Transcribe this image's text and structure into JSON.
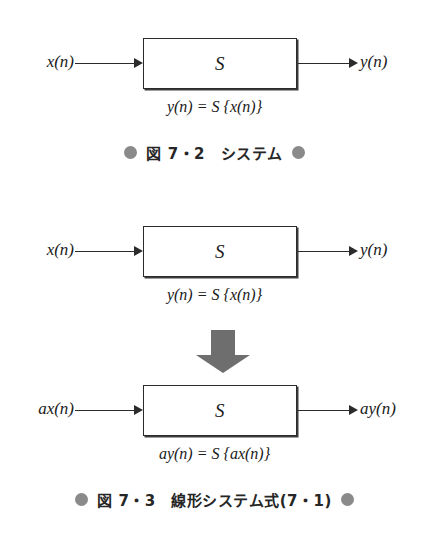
{
  "figure_1": {
    "box_label": "S",
    "input_label": "x(n)",
    "output_label": "y(n)",
    "formula": "y(n) = S {x(n)}",
    "caption": "図 7・2　システム"
  },
  "figure_2": {
    "upper": {
      "box_label": "S",
      "input_label": "x(n)",
      "output_label": "y(n)",
      "formula": "y(n) = S {x(n)}"
    },
    "lower": {
      "box_label": "S",
      "input_label": "ax(n)",
      "output_label": "ay(n)",
      "formula": "ay(n) = S {ax(n)}"
    },
    "caption": "図 7・3　線形システム式(7・1)"
  },
  "colors": {
    "line": "#2b2b2b",
    "bullet": "#8a8a8a",
    "big_arrow": "#6e6e6e",
    "background": "#ffffff"
  }
}
